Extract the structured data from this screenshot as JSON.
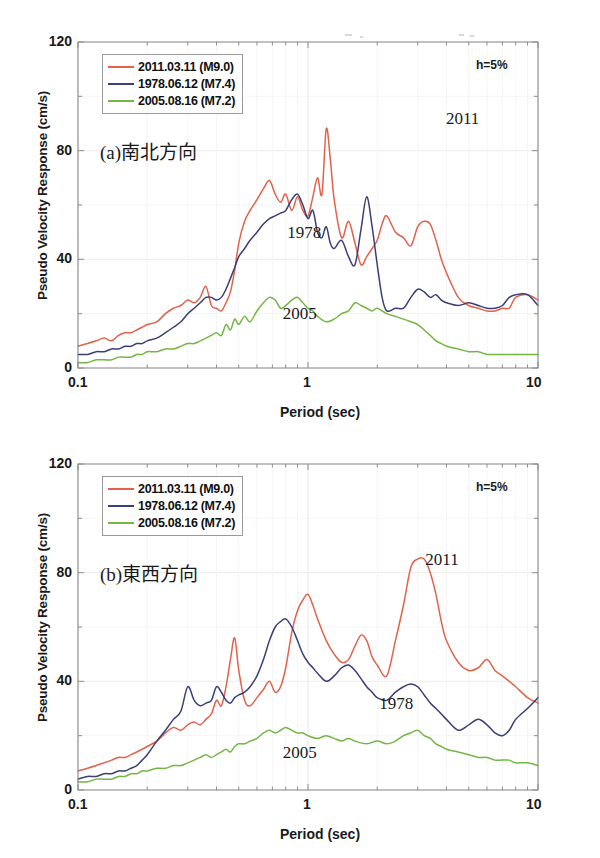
{
  "figure": {
    "axis_title_y": "Pseudo Velocity Response (cm/s)",
    "axis_title_x": "Period (sec)",
    "damping_note": "h=5%",
    "y_ticks": [
      "0",
      "40",
      "80",
      "120"
    ],
    "x_ticks": [
      "0.1",
      "1",
      "10"
    ],
    "colors": {
      "series_2011": "#e2624c",
      "series_1978": "#3b3f78",
      "series_2005": "#74b544",
      "axis": "#8c8c8c",
      "grid": "#ededed",
      "text": "#1a1a1a"
    },
    "legend": [
      {
        "label": "2011.03.11 (M9.0)",
        "color": "#e2624c"
      },
      {
        "label": "1978.06.12 (M7.4)",
        "color": "#3b3f78"
      },
      {
        "label": "2005.08.16 (M7.2)",
        "color": "#74b544"
      }
    ]
  },
  "panels": {
    "a": {
      "tag": "(a)南北方向",
      "annotations": [
        {
          "text": "2011",
          "x": 0.8,
          "y": 0.205
        },
        {
          "text": "1978",
          "x": 0.455,
          "y": 0.555
        },
        {
          "text": "2005",
          "x": 0.445,
          "y": 0.805
        }
      ]
    },
    "b": {
      "tag": "(b)東西方向",
      "annotations": [
        {
          "text": "2011",
          "x": 0.755,
          "y": 0.265
        },
        {
          "text": "1978",
          "x": 0.655,
          "y": 0.705
        },
        {
          "text": "2005",
          "x": 0.445,
          "y": 0.855
        }
      ]
    }
  },
  "chart_data": [
    {
      "type": "line",
      "title": "(a)南北方向",
      "subtitle": "h=5%",
      "xlabel": "Period (sec)",
      "ylabel": "Pseudo Velocity Response (cm/s)",
      "xscale": "log",
      "xlim": [
        0.1,
        10
      ],
      "ylim": [
        0,
        120
      ],
      "yticks": [
        0,
        40,
        80,
        120
      ],
      "xticks": [
        0.1,
        1,
        10
      ],
      "grid": true,
      "legend_position": "top-left",
      "series": [
        {
          "name": "2011.03.11 (M9.0)",
          "color": "#e2624c",
          "x": [
            0.1,
            0.11,
            0.12,
            0.13,
            0.14,
            0.15,
            0.16,
            0.17,
            0.18,
            0.19,
            0.2,
            0.22,
            0.24,
            0.26,
            0.28,
            0.3,
            0.32,
            0.34,
            0.36,
            0.38,
            0.4,
            0.42,
            0.44,
            0.46,
            0.48,
            0.5,
            0.53,
            0.56,
            0.6,
            0.64,
            0.68,
            0.72,
            0.76,
            0.8,
            0.85,
            0.9,
            0.95,
            1.0,
            1.05,
            1.1,
            1.15,
            1.2,
            1.25,
            1.3,
            1.4,
            1.5,
            1.6,
            1.7,
            1.8,
            1.9,
            2.0,
            2.1,
            2.2,
            2.4,
            2.6,
            2.8,
            3.0,
            3.2,
            3.4,
            3.6,
            3.8,
            4.0,
            4.5,
            5.0,
            5.5,
            6.0,
            6.5,
            7.0,
            7.5,
            8.0,
            9.0,
            10.0
          ],
          "y": [
            8,
            9,
            10,
            11,
            10,
            12,
            13,
            13,
            14,
            15,
            16,
            17,
            20,
            22,
            23,
            25,
            24,
            26,
            30,
            23,
            22,
            21,
            24,
            28,
            36,
            46,
            54,
            58,
            62,
            66,
            69,
            64,
            61,
            64,
            58,
            63,
            58,
            56,
            63,
            70,
            64,
            88,
            77,
            62,
            48,
            54,
            46,
            38,
            41,
            44,
            47,
            53,
            56,
            50,
            48,
            45,
            52,
            54,
            53,
            47,
            40,
            35,
            26,
            23,
            22,
            21,
            21,
            22,
            22,
            26,
            27,
            25
          ]
        },
        {
          "name": "1978.06.12 (M7.4)",
          "color": "#3b3f78",
          "x": [
            0.1,
            0.11,
            0.12,
            0.13,
            0.14,
            0.15,
            0.16,
            0.17,
            0.18,
            0.19,
            0.2,
            0.22,
            0.24,
            0.26,
            0.28,
            0.3,
            0.32,
            0.34,
            0.36,
            0.38,
            0.4,
            0.42,
            0.44,
            0.46,
            0.48,
            0.5,
            0.53,
            0.56,
            0.6,
            0.64,
            0.68,
            0.72,
            0.76,
            0.8,
            0.85,
            0.9,
            0.95,
            1.0,
            1.05,
            1.1,
            1.15,
            1.2,
            1.25,
            1.3,
            1.4,
            1.5,
            1.6,
            1.7,
            1.8,
            1.9,
            2.0,
            2.1,
            2.2,
            2.4,
            2.6,
            2.8,
            3.0,
            3.2,
            3.4,
            3.6,
            3.8,
            4.0,
            4.5,
            5.0,
            5.5,
            6.0,
            6.5,
            7.0,
            7.5,
            8.0,
            9.0,
            10.0
          ],
          "y": [
            5,
            5,
            6,
            6,
            7,
            7,
            8,
            8,
            9,
            9,
            10,
            11,
            13,
            15,
            17,
            20,
            22,
            24,
            26,
            26,
            25,
            26,
            29,
            33,
            37,
            41,
            44,
            47,
            50,
            53,
            55,
            56,
            57,
            58,
            62,
            64,
            60,
            55,
            58,
            50,
            48,
            52,
            46,
            44,
            47,
            41,
            38,
            51,
            63,
            52,
            38,
            26,
            21,
            22,
            22,
            26,
            29,
            28,
            26,
            27,
            25,
            24,
            23,
            24,
            23,
            22,
            22,
            23,
            26,
            27,
            27,
            23
          ]
        },
        {
          "name": "2005.08.16 (M7.2)",
          "color": "#74b544",
          "x": [
            0.1,
            0.11,
            0.12,
            0.13,
            0.14,
            0.15,
            0.16,
            0.17,
            0.18,
            0.19,
            0.2,
            0.22,
            0.24,
            0.26,
            0.28,
            0.3,
            0.32,
            0.34,
            0.36,
            0.38,
            0.4,
            0.42,
            0.44,
            0.46,
            0.48,
            0.5,
            0.53,
            0.56,
            0.6,
            0.64,
            0.68,
            0.72,
            0.76,
            0.8,
            0.85,
            0.9,
            0.95,
            1.0,
            1.05,
            1.1,
            1.2,
            1.3,
            1.4,
            1.5,
            1.6,
            1.7,
            1.8,
            1.9,
            2.0,
            2.2,
            2.4,
            2.6,
            2.8,
            3.0,
            3.2,
            3.4,
            3.6,
            3.8,
            4.0,
            4.5,
            5.0,
            5.5,
            6.0,
            6.5,
            7.0,
            7.5,
            8.0,
            9.0,
            10.0
          ],
          "y": [
            2,
            2,
            3,
            3,
            3,
            4,
            4,
            4,
            5,
            5,
            6,
            6,
            7,
            7,
            8,
            9,
            9,
            10,
            11,
            12,
            13,
            12,
            16,
            14,
            18,
            16,
            19,
            17,
            21,
            24,
            26,
            25,
            22,
            23,
            25,
            26,
            24,
            22,
            21,
            19,
            17,
            18,
            20,
            21,
            24,
            23,
            22,
            21,
            22,
            20,
            19,
            18,
            17,
            16,
            14,
            12,
            10,
            9,
            8,
            7,
            6,
            6,
            5,
            5,
            5,
            5,
            5,
            5,
            5
          ]
        }
      ]
    },
    {
      "type": "line",
      "title": "(b)東西方向",
      "subtitle": "h=5%",
      "xlabel": "Period (sec)",
      "ylabel": "Pseudo Velocity Response (cm/s)",
      "xscale": "log",
      "xlim": [
        0.1,
        10
      ],
      "ylim": [
        0,
        120
      ],
      "yticks": [
        0,
        40,
        80,
        120
      ],
      "xticks": [
        0.1,
        1,
        10
      ],
      "grid": true,
      "legend_position": "top-left",
      "series": [
        {
          "name": "2011.03.11 (M9.0)",
          "color": "#e2624c",
          "x": [
            0.1,
            0.11,
            0.12,
            0.13,
            0.14,
            0.15,
            0.16,
            0.17,
            0.18,
            0.19,
            0.2,
            0.22,
            0.24,
            0.26,
            0.28,
            0.3,
            0.32,
            0.34,
            0.36,
            0.38,
            0.4,
            0.42,
            0.44,
            0.46,
            0.48,
            0.5,
            0.53,
            0.56,
            0.6,
            0.64,
            0.68,
            0.72,
            0.76,
            0.8,
            0.85,
            0.9,
            0.95,
            1.0,
            1.05,
            1.1,
            1.2,
            1.3,
            1.4,
            1.5,
            1.6,
            1.7,
            1.8,
            1.9,
            2.0,
            2.2,
            2.4,
            2.6,
            2.8,
            3.0,
            3.2,
            3.4,
            3.6,
            3.8,
            4.0,
            4.5,
            5.0,
            5.5,
            6.0,
            6.5,
            7.0,
            7.5,
            8.0,
            9.0,
            10.0
          ],
          "y": [
            7,
            8,
            9,
            10,
            11,
            12,
            12,
            13,
            14,
            15,
            16,
            18,
            21,
            23,
            22,
            24,
            25,
            24,
            26,
            28,
            33,
            31,
            38,
            48,
            56,
            44,
            33,
            31,
            34,
            37,
            40,
            36,
            38,
            45,
            58,
            66,
            70,
            72,
            68,
            63,
            55,
            50,
            47,
            48,
            53,
            57,
            55,
            49,
            46,
            42,
            55,
            68,
            82,
            85,
            85,
            80,
            72,
            62,
            55,
            47,
            44,
            45,
            48,
            44,
            42,
            40,
            38,
            34,
            32
          ]
        },
        {
          "name": "1978.06.12 (M7.4)",
          "color": "#3b3f78",
          "x": [
            0.1,
            0.11,
            0.12,
            0.13,
            0.14,
            0.15,
            0.16,
            0.17,
            0.18,
            0.19,
            0.2,
            0.22,
            0.24,
            0.26,
            0.28,
            0.3,
            0.32,
            0.34,
            0.36,
            0.38,
            0.4,
            0.42,
            0.44,
            0.46,
            0.48,
            0.5,
            0.53,
            0.56,
            0.6,
            0.64,
            0.68,
            0.72,
            0.76,
            0.8,
            0.85,
            0.9,
            0.95,
            1.0,
            1.05,
            1.1,
            1.2,
            1.3,
            1.4,
            1.5,
            1.6,
            1.7,
            1.8,
            1.9,
            2.0,
            2.2,
            2.4,
            2.6,
            2.8,
            3.0,
            3.2,
            3.4,
            3.6,
            3.8,
            4.0,
            4.5,
            5.0,
            5.5,
            6.0,
            6.5,
            7.0,
            7.5,
            8.0,
            9.0,
            10.0
          ],
          "y": [
            4,
            5,
            5,
            6,
            6,
            7,
            7,
            8,
            9,
            11,
            13,
            18,
            22,
            26,
            29,
            38,
            33,
            31,
            32,
            33,
            38,
            36,
            33,
            32,
            34,
            35,
            36,
            38,
            42,
            48,
            55,
            60,
            62,
            63,
            60,
            55,
            50,
            47,
            45,
            43,
            40,
            42,
            45,
            46,
            44,
            41,
            38,
            36,
            34,
            33,
            36,
            38,
            39,
            38,
            35,
            32,
            30,
            28,
            26,
            22,
            24,
            26,
            24,
            21,
            20,
            22,
            26,
            30,
            34
          ]
        },
        {
          "name": "2005.08.16 (M7.2)",
          "color": "#74b544",
          "x": [
            0.1,
            0.11,
            0.12,
            0.13,
            0.14,
            0.15,
            0.16,
            0.17,
            0.18,
            0.19,
            0.2,
            0.22,
            0.24,
            0.26,
            0.28,
            0.3,
            0.32,
            0.34,
            0.36,
            0.38,
            0.4,
            0.42,
            0.44,
            0.46,
            0.48,
            0.5,
            0.53,
            0.56,
            0.6,
            0.64,
            0.68,
            0.72,
            0.76,
            0.8,
            0.85,
            0.9,
            0.95,
            1.0,
            1.1,
            1.2,
            1.3,
            1.4,
            1.5,
            1.6,
            1.8,
            2.0,
            2.2,
            2.4,
            2.6,
            2.8,
            3.0,
            3.2,
            3.4,
            3.6,
            3.8,
            4.0,
            4.5,
            5.0,
            5.5,
            6.0,
            6.5,
            7.0,
            7.5,
            8.0,
            9.0,
            10.0
          ],
          "y": [
            3,
            3,
            4,
            4,
            4,
            5,
            5,
            6,
            6,
            7,
            7,
            8,
            8,
            9,
            9,
            10,
            11,
            12,
            13,
            12,
            13,
            14,
            15,
            14,
            16,
            17,
            17,
            18,
            19,
            21,
            22,
            21,
            22,
            23,
            22,
            21,
            21,
            20,
            19,
            20,
            19,
            18,
            19,
            18,
            17,
            18,
            17,
            18,
            20,
            21,
            22,
            20,
            19,
            17,
            16,
            15,
            14,
            13,
            12,
            12,
            11,
            11,
            11,
            10,
            10,
            9
          ]
        }
      ]
    }
  ]
}
